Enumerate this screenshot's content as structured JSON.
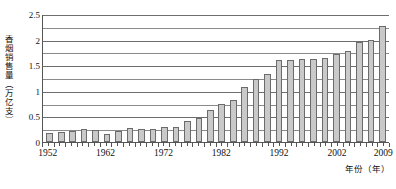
{
  "chart_data": {
    "type": "bar",
    "title": "",
    "xlabel": "年份（年）",
    "ylabel": "香烟销售量（万亿支）",
    "ylim": [
      0,
      2.5
    ],
    "ytick_labels": [
      "0",
      "0.5",
      "1",
      "1.5",
      "2",
      "2.5"
    ],
    "ytick_values": [
      0,
      0.5,
      1,
      1.5,
      2,
      2.5
    ],
    "gridline_step": 0.25,
    "grid": true,
    "legend": "none",
    "xtick_labels": [
      "1952",
      "1962",
      "1972",
      "1982",
      "1992",
      "2002",
      "2009"
    ],
    "xtick_years": [
      1952,
      1962,
      1972,
      1982,
      1992,
      2002,
      2009
    ],
    "x": [
      1952,
      1954,
      1956,
      1958,
      1960,
      1962,
      1964,
      1966,
      1968,
      1970,
      1972,
      1974,
      1976,
      1978,
      1980,
      1982,
      1984,
      1986,
      1988,
      1990,
      1992,
      1994,
      1996,
      1998,
      2000,
      2002,
      2004,
      2006,
      2008,
      2009
    ],
    "categories": [
      "1952",
      "1954",
      "1956",
      "1958",
      "1960",
      "1962",
      "1964",
      "1966",
      "1968",
      "1970",
      "1972",
      "1974",
      "1976",
      "1978",
      "1980",
      "1982",
      "1984",
      "1986",
      "1988",
      "1990",
      "1992",
      "1994",
      "1996",
      "1998",
      "2000",
      "2002",
      "2004",
      "2006",
      "2008",
      "2009"
    ],
    "values": [
      0.17,
      0.2,
      0.22,
      0.25,
      0.24,
      0.15,
      0.22,
      0.27,
      0.25,
      0.25,
      0.3,
      0.3,
      0.41,
      0.46,
      0.63,
      0.75,
      0.82,
      1.07,
      1.23,
      1.33,
      1.6,
      1.6,
      1.62,
      1.63,
      1.65,
      1.72,
      1.78,
      1.95,
      2.0,
      2.27
    ],
    "series": [
      {
        "name": "香烟销售量",
        "values": [
          0.17,
          0.2,
          0.22,
          0.25,
          0.24,
          0.15,
          0.22,
          0.27,
          0.25,
          0.25,
          0.3,
          0.3,
          0.41,
          0.46,
          0.63,
          0.75,
          0.82,
          1.07,
          1.23,
          1.33,
          1.6,
          1.6,
          1.62,
          1.63,
          1.65,
          1.72,
          1.78,
          1.95,
          2.0,
          2.27
        ]
      }
    ],
    "bar_color": "#c9c9c9",
    "bar_border_color": "#6b6b6b",
    "axis_color": "#555555",
    "grid_color": "#8a8a8a"
  },
  "caption": ""
}
